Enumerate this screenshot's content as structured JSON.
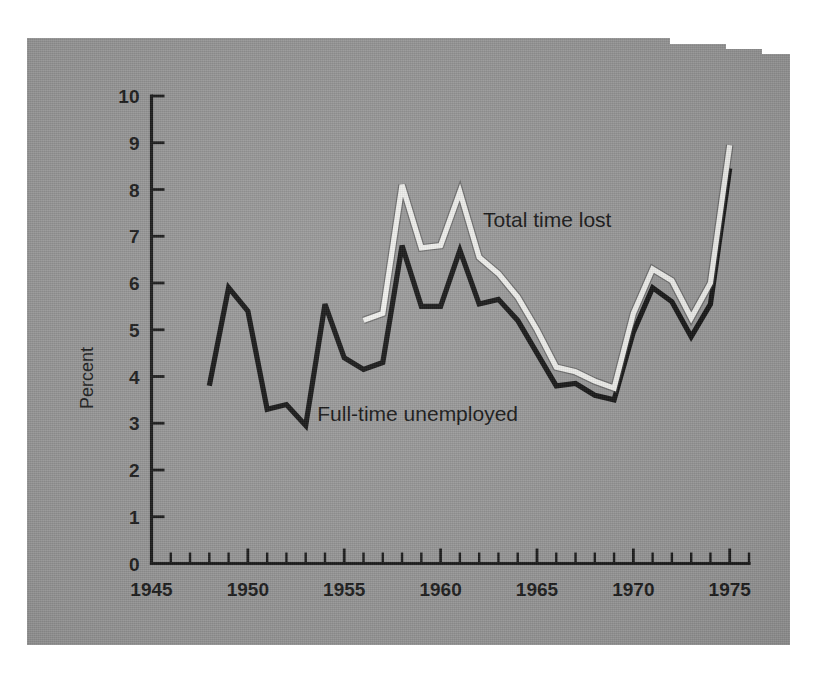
{
  "chart_data": {
    "type": "line",
    "title": "",
    "xlabel": "",
    "ylabel": "Percent",
    "xlim": [
      1945,
      1976
    ],
    "ylim": [
      0,
      10
    ],
    "grid": false,
    "legend_position": "inline-annotation",
    "x_tick_labels": [
      "1945",
      "1950",
      "1955",
      "1960",
      "1965",
      "1970",
      "1975"
    ],
    "x_tick_values": [
      1945,
      1950,
      1955,
      1960,
      1965,
      1970,
      1975
    ],
    "x_minor_tick_step": 1,
    "y_tick_labels": [
      "0",
      "1",
      "2",
      "3",
      "4",
      "5",
      "6",
      "7",
      "8",
      "9",
      "10"
    ],
    "y_tick_values": [
      0,
      1,
      2,
      3,
      4,
      5,
      6,
      7,
      8,
      9,
      10
    ],
    "series": [
      {
        "name": "Full-time unemployed",
        "color": "#151515",
        "style": "dark-solid",
        "x": [
          1948,
          1949,
          1950,
          1951,
          1952,
          1953,
          1954,
          1955,
          1956,
          1957,
          1958,
          1959,
          1960,
          1961,
          1962,
          1963,
          1964,
          1965,
          1966,
          1967,
          1968,
          1969,
          1970,
          1971,
          1972,
          1973,
          1974,
          1975
        ],
        "values": [
          3.8,
          5.9,
          5.4,
          3.3,
          3.4,
          2.95,
          5.55,
          4.4,
          4.15,
          4.3,
          6.8,
          5.5,
          5.5,
          6.7,
          5.55,
          5.65,
          5.2,
          4.5,
          3.8,
          3.85,
          3.6,
          3.5,
          4.95,
          5.9,
          5.6,
          4.85,
          5.55,
          8.45
        ]
      },
      {
        "name": "Total time lost",
        "color": "#f3f3f0",
        "style": "white-solid",
        "x": [
          1956,
          1957,
          1958,
          1959,
          1960,
          1961,
          1962,
          1963,
          1964,
          1965,
          1966,
          1967,
          1968,
          1969,
          1970,
          1971,
          1972,
          1973,
          1974,
          1975
        ],
        "values": [
          5.2,
          5.35,
          8.1,
          6.75,
          6.8,
          7.95,
          6.55,
          6.2,
          5.7,
          5.0,
          4.2,
          4.1,
          3.9,
          3.75,
          5.35,
          6.3,
          6.05,
          5.25,
          6.0,
          8.95
        ]
      }
    ],
    "annotations": [
      {
        "text": "Total time lost",
        "x": 1962.2,
        "y": 7.2
      },
      {
        "text": "Full-time unemployed",
        "x": 1953.6,
        "y": 3.05
      }
    ]
  },
  "figure": {
    "background_color": "#9b9b9b",
    "page_color": "#ffffff",
    "axis_color": "#1a1a1a"
  }
}
